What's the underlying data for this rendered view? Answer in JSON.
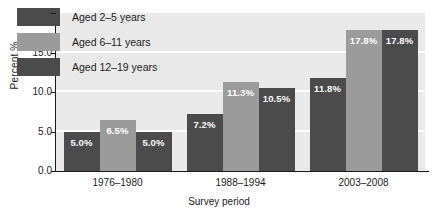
{
  "chart_data": {
    "type": "bar",
    "title": "",
    "xlabel": "Survey period",
    "ylabel": "Percent %",
    "categories": [
      "1976–1980",
      "1988–1994",
      "2003–2008"
    ],
    "series": [
      {
        "name": "Aged 2–5 years",
        "color": "#4b4b4b",
        "values": [
          5.0,
          7.2,
          11.8
        ],
        "labels": [
          "5.0%",
          "7.2%",
          "11.8%"
        ]
      },
      {
        "name": "Aged 6–11 years",
        "color": "#9b9b9b",
        "values": [
          6.5,
          11.3,
          17.8
        ],
        "labels": [
          "6.5%",
          "11.3%",
          "17.8%"
        ]
      },
      {
        "name": "Aged 12–19 years",
        "color": "#4b4b4b",
        "values": [
          5.0,
          10.5,
          17.8
        ],
        "labels": [
          "5.0%",
          "10.5%",
          "17.8%"
        ]
      }
    ],
    "ylim": [
      0.0,
      20.0
    ],
    "yticks": [
      0.0,
      5.0,
      10.0,
      15.0,
      20.0
    ],
    "ytick_labels": [
      "0.0",
      "5.0",
      "10.0",
      "15.0",
      "20.0"
    ],
    "grid": true,
    "gridline_color": "#fbfbfb",
    "plot_background": "#e9e9e9",
    "legend_position": "upper left (inside plot area)",
    "label_color": "#ffffff"
  },
  "axis": {
    "y_title": "Percent %",
    "x_title": "Survey period"
  },
  "legend": {
    "entries": [
      {
        "label": "Aged 2–5 years",
        "color": "#4b4b4b"
      },
      {
        "label": "Aged 6–11 years",
        "color": "#9b9b9b"
      },
      {
        "label": "Aged 12–19 years",
        "color": "#4b4b4b"
      }
    ]
  }
}
